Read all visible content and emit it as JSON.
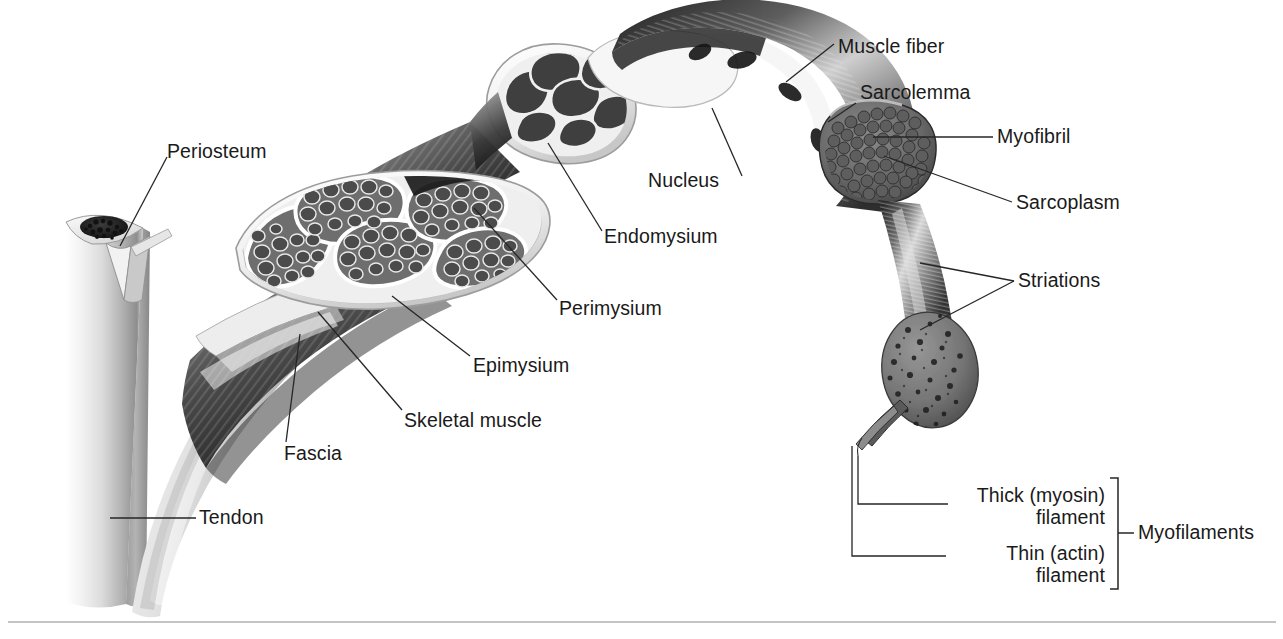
{
  "figure": {
    "background_color": "#ffffff",
    "text_color": "#1a1a1a",
    "leader_line_color": "#262626",
    "width": 1283,
    "height": 639
  },
  "labels": {
    "periosteum": "Periosteum",
    "tendon": "Tendon",
    "fascia": "Fascia",
    "skeletal_muscle": "Skeletal muscle",
    "epimysium": "Epimysium",
    "perimysium": "Perimysium",
    "endomysium": "Endomysium",
    "nucleus": "Nucleus",
    "muscle_fiber": "Muscle fiber",
    "sarcolemma": "Sarcolemma",
    "myofibril": "Myofibril",
    "sarcoplasm": "Sarcoplasm",
    "striations": "Striations",
    "thick_filament_line1": "Thick (myosin)",
    "thick_filament_line2": "filament",
    "thin_filament_line1": "Thin (actin)",
    "thin_filament_line2": "filament",
    "myofilaments": "Myofilaments"
  },
  "structures": [
    {
      "name": "bone",
      "description": "Cut long bone shaft with spongy marrow at cut end and periosteum membrane peeled back"
    },
    {
      "name": "tendon",
      "description": "Pale fibrous band joining muscle to bone"
    },
    {
      "name": "skeletal-muscle-belly",
      "description": "Dark striated muscle belly wrapped in fascia"
    },
    {
      "name": "muscle-cross-section",
      "description": "Cut face of whole muscle showing fascicles bounded by perimysium inside epimysium"
    },
    {
      "name": "fascicle-cross-section",
      "description": "Enlarged single fascicle cut face showing muscle fibers bounded by endomysium"
    },
    {
      "name": "muscle-fiber",
      "description": "Single enlarged muscle fiber with sarcolemma, peripheral nuclei and cut face of myofibrils in sarcoplasm"
    },
    {
      "name": "myofibril",
      "description": "Enlarged single myofibril strand with striations and cut face showing myofilaments"
    },
    {
      "name": "myofilaments",
      "description": "Two filament strands projecting from the myofibril cut face: thick myosin and thin actin"
    }
  ],
  "bracket": {
    "name": "myofilaments-bracket",
    "groups": [
      "Thick (myosin) filament",
      "Thin (actin) filament"
    ]
  }
}
